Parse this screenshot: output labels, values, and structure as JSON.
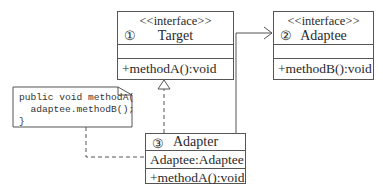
{
  "diagram": {
    "type": "UML class diagram - Adapter pattern",
    "classes": [
      {
        "id": "target",
        "number": "①",
        "stereotype": "<<interface>>",
        "name": "Target",
        "attributes": "",
        "methods": "+methodA():void"
      },
      {
        "id": "adaptee",
        "number": "②",
        "stereotype": "<<interface>>",
        "name": "Adaptee",
        "attributes": "",
        "methods": "+methodB():void"
      },
      {
        "id": "adapter",
        "number": "③",
        "stereotype": "",
        "name": "Adapter",
        "attributes": "Adaptee:Adaptee",
        "methods": "+methodA():void"
      }
    ],
    "note": {
      "line1": "public void methodA(",
      "line2": "  adaptee.methodB();",
      "line3": "}"
    },
    "relations": [
      {
        "from": "adapter",
        "to": "target",
        "kind": "realization"
      },
      {
        "from": "adapter",
        "to": "adaptee",
        "kind": "association"
      },
      {
        "from": "note",
        "to": "adapter",
        "kind": "note-anchor"
      }
    ],
    "colors": {
      "line": "#555555",
      "text": "#2a2a2a",
      "background": "#ffffff"
    }
  }
}
